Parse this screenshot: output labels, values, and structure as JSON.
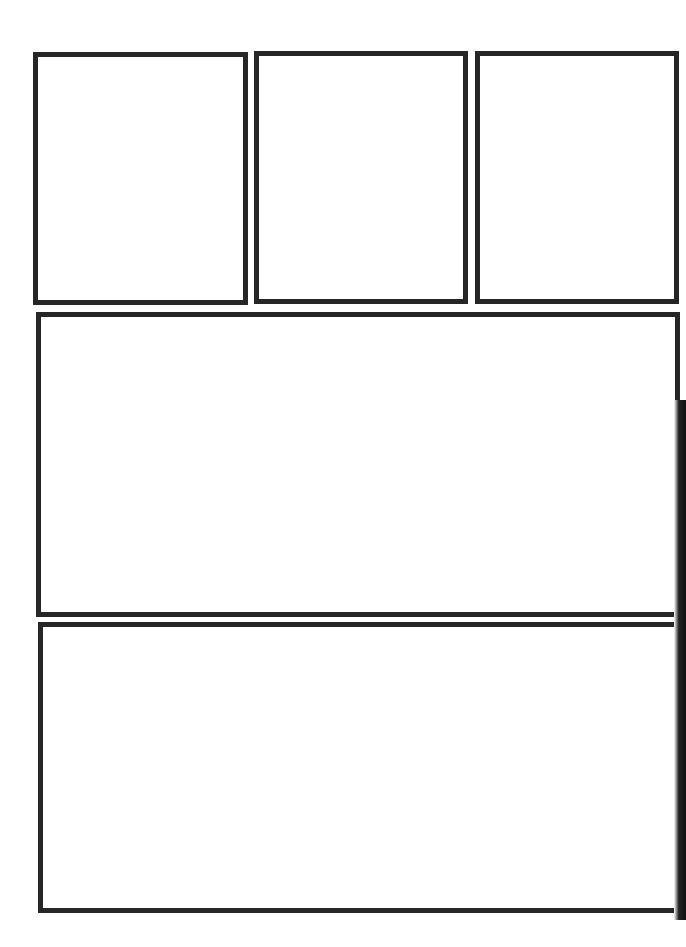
{
  "page": {
    "type": "comic-panel-template",
    "background": "#ffffff",
    "border_color": "#262626"
  },
  "panels": [
    {
      "id": 1,
      "row": 1,
      "label": ""
    },
    {
      "id": 2,
      "row": 1,
      "label": ""
    },
    {
      "id": 3,
      "row": 1,
      "label": ""
    },
    {
      "id": 4,
      "row": 2,
      "label": ""
    },
    {
      "id": 5,
      "row": 3,
      "label": ""
    }
  ]
}
